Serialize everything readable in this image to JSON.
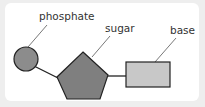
{
  "diagram": {
    "labels": {
      "phosphate": "phosphate",
      "sugar": "sugar",
      "base": "base"
    },
    "colors": {
      "phosphate_fill": "#8c8c8c",
      "sugar_fill": "#7f7f7f",
      "base_fill": "#c8c8c8",
      "stroke": "#222222",
      "leader": "#555555"
    }
  }
}
